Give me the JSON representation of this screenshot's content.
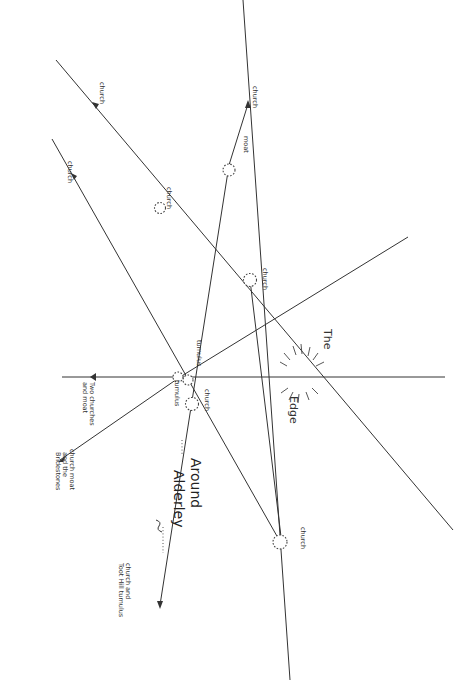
{
  "diagram": {
    "title_line1": "Around",
    "title_line2": "Alderley",
    "edge_label_1": "The",
    "edge_label_2": "Edge",
    "sites": {
      "church_top": "church",
      "moat": "moat",
      "church_left_upper": "church",
      "church_left_arrow": "church",
      "church_mid_upper": "church",
      "church_right_mid": "church",
      "tumulus_1": "tumulus",
      "tumulus_2": "tumulus",
      "church_center": "church",
      "two_churches_1": "Two churches",
      "two_churches_2": "and moat",
      "church_moat_1": "church moat",
      "church_moat_2": "and the",
      "church_moat_3": "Bridestones",
      "church_bottom_right": "church",
      "church_toot_1": "church and",
      "church_toot_2": "Toot Hill tumulus"
    }
  }
}
